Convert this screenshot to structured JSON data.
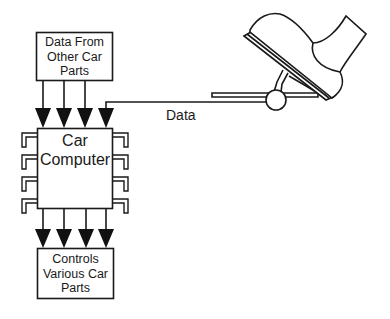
{
  "diagram": {
    "input_box": {
      "lines": [
        "Data From",
        "Other Car",
        "Parts"
      ]
    },
    "computer": {
      "lines": [
        "Car",
        "Computer"
      ]
    },
    "output_box": {
      "lines": [
        "Controls",
        "Various Car",
        "Parts"
      ]
    },
    "signal_label": "Data",
    "sensor": "accelerator-pedal-with-foot",
    "input_arrows": 4,
    "output_arrows": 4,
    "chip_pins_per_side": 4
  }
}
